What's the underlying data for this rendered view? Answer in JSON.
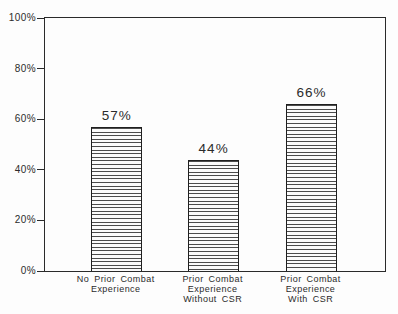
{
  "chart_data": {
    "type": "bar",
    "title": "",
    "xlabel": "",
    "ylabel": "",
    "ylim": [
      0,
      100
    ],
    "grid": false,
    "legend": "none",
    "bar_fill_style": "horizontal-stripes",
    "colors": {
      "background": "#fdfdfd",
      "axis": "#2a2a2a",
      "bar_border": "#1f1f1f",
      "bar_stripe": "#4c4c4c",
      "text": "#2b2b2b"
    },
    "y_ticks": [
      {
        "label": "0%",
        "value": 0
      },
      {
        "label": "20%",
        "value": 20
      },
      {
        "label": "40%",
        "value": 40
      },
      {
        "label": "60%",
        "value": 60
      },
      {
        "label": "80%",
        "value": 80
      },
      {
        "label": "100%",
        "value": 100
      }
    ],
    "categories": [
      "No Prior Combat\nExperience",
      "Prior Combat\nExperience\nWithout CSR",
      "Prior Combat\nExperience\nWith CSR"
    ],
    "values": [
      57,
      44,
      66
    ],
    "value_labels": [
      "57%",
      "44%",
      "66%"
    ]
  }
}
